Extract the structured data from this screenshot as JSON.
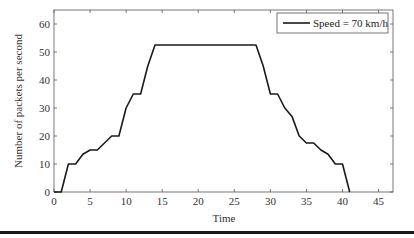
{
  "chart_data": {
    "type": "line",
    "title": "",
    "xlabel": "Time",
    "ylabel": "Number of packets per second",
    "xlim": [
      0,
      47
    ],
    "ylim": [
      0,
      65
    ],
    "xticks": [
      0,
      5,
      10,
      15,
      20,
      25,
      30,
      35,
      40,
      45
    ],
    "yticks": [
      0,
      10,
      20,
      30,
      40,
      50,
      60
    ],
    "grid": false,
    "legend_position": "upper right",
    "series": [
      {
        "name": "Speed = 70 km/h",
        "color": "#1a1a1a",
        "x": [
          0,
          1,
          2,
          3,
          4,
          5,
          6,
          7,
          8,
          9,
          10,
          11,
          12,
          13,
          14,
          15,
          16,
          17,
          18,
          19,
          20,
          21,
          22,
          23,
          24,
          25,
          26,
          27,
          28,
          29,
          30,
          31,
          32,
          33,
          34,
          35,
          36,
          37,
          38,
          39,
          40,
          41
        ],
        "values": [
          0,
          0,
          10,
          10,
          13.5,
          15,
          15,
          17.5,
          20,
          20,
          30,
          35,
          35,
          45,
          52.5,
          52.5,
          52.5,
          52.5,
          52.5,
          52.5,
          52.5,
          52.5,
          52.5,
          52.5,
          52.5,
          52.5,
          52.5,
          52.5,
          52.5,
          45,
          35,
          35,
          30,
          27,
          20,
          17.5,
          17.5,
          15,
          13.5,
          10,
          10,
          0
        ]
      }
    ]
  }
}
